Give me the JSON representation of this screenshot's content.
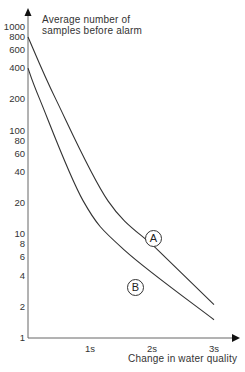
{
  "chart_data": {
    "type": "line",
    "title": "",
    "ylabel": "Average number of samples before alarm",
    "ylabel_lines": [
      "Average number of",
      "samples before alarm"
    ],
    "xlabel": "Change in water quality",
    "yscale": "log",
    "ylim": [
      1,
      1000
    ],
    "xlim": [
      0,
      3.3
    ],
    "grid": false,
    "legend": "inline circled labels",
    "yticks": [
      {
        "label": "1000",
        "value": 1000
      },
      {
        "label": "800",
        "value": 800
      },
      {
        "label": "600",
        "value": 600
      },
      {
        "label": "400",
        "value": 400
      },
      {
        "label": "200",
        "value": 200
      },
      {
        "label": "100",
        "value": 100
      },
      {
        "label": "80",
        "value": 80
      },
      {
        "label": "60",
        "value": 60
      },
      {
        "label": "40",
        "value": 40
      },
      {
        "label": "20",
        "value": 20
      },
      {
        "label": "10",
        "value": 10
      },
      {
        "label": "8",
        "value": 8
      },
      {
        "label": "6",
        "value": 6
      },
      {
        "label": "4",
        "value": 4
      },
      {
        "label": "2",
        "value": 2
      },
      {
        "label": "1",
        "value": 1
      }
    ],
    "xticks": [
      {
        "label": "1s",
        "value": 1
      },
      {
        "label": "2s",
        "value": 2
      },
      {
        "label": "3s",
        "value": 3
      }
    ],
    "series": [
      {
        "name": "A",
        "x": [
          0,
          0.45,
          1.29,
          2.1,
          3.0
        ],
        "values": [
          800,
          200,
          21,
          7,
          2.1
        ]
      },
      {
        "name": "B",
        "x": [
          0,
          0.19,
          0.89,
          1.56,
          3.0
        ],
        "values": [
          400,
          200,
          21,
          7,
          1.5
        ]
      }
    ]
  },
  "labels": {
    "curve_a": "A",
    "curve_b": "B"
  }
}
